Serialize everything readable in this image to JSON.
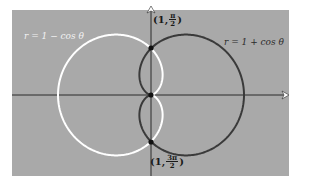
{
  "figure": {
    "background_color": "#a9a9a9",
    "curves": [
      {
        "label": "r = 1 − cos θ",
        "color": "#ffffff"
      },
      {
        "label": "r = 1 + cos θ",
        "color": "#3a3a3a"
      }
    ],
    "points": {
      "top": {
        "open": "(1,",
        "num": "π",
        "den": "2",
        "close": ")"
      },
      "bottom": {
        "open": "(1,",
        "num": "3π",
        "den": "2",
        "close": ")"
      }
    }
  },
  "chart_data": {
    "type": "polar",
    "title": "",
    "series": [
      {
        "name": "r = 1 − cos θ",
        "equation": "r = 1 - cos(theta)",
        "color": "#ffffff",
        "extent_x": [
          -2,
          0
        ]
      },
      {
        "name": "r = 1 + cos θ",
        "equation": "r = 1 + cos(theta)",
        "color": "#3a3a3a",
        "extent_x": [
          0,
          2
        ]
      }
    ],
    "intersections": [
      {
        "label": "(1, π/2)",
        "r": 1,
        "theta": "π/2"
      },
      {
        "label": "(1, 3π/2)",
        "r": 1,
        "theta": "3π/2"
      },
      {
        "label": "pole",
        "r": 0,
        "theta": 0
      }
    ],
    "axes": {
      "x_axis_arrow": true,
      "y_axis_arrow": true,
      "grid": false
    }
  }
}
